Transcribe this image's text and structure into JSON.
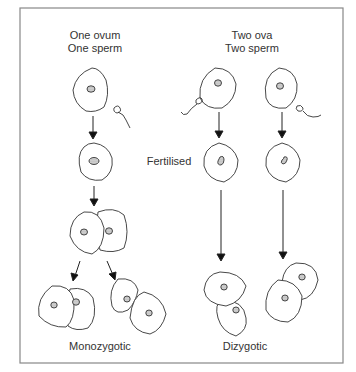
{
  "diagram": {
    "left_column": {
      "header_line1": "One ovum",
      "header_line2": "One sperm",
      "footer": "Monozygotic"
    },
    "right_column": {
      "header_line1": "Two ova",
      "header_line2": "Two sperm",
      "footer": "Dizygotic"
    },
    "middle_label": "Fertilised"
  }
}
